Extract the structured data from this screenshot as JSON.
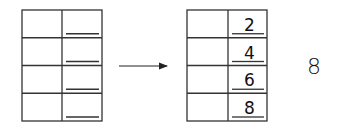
{
  "diagram": {
    "left_table": {
      "rows": 4,
      "values": [
        "",
        "",
        "",
        ""
      ]
    },
    "arrow": {
      "direction": "right"
    },
    "right_table": {
      "rows": 4,
      "values": [
        "2",
        "4",
        "6",
        "8"
      ]
    },
    "side_label": "8"
  }
}
